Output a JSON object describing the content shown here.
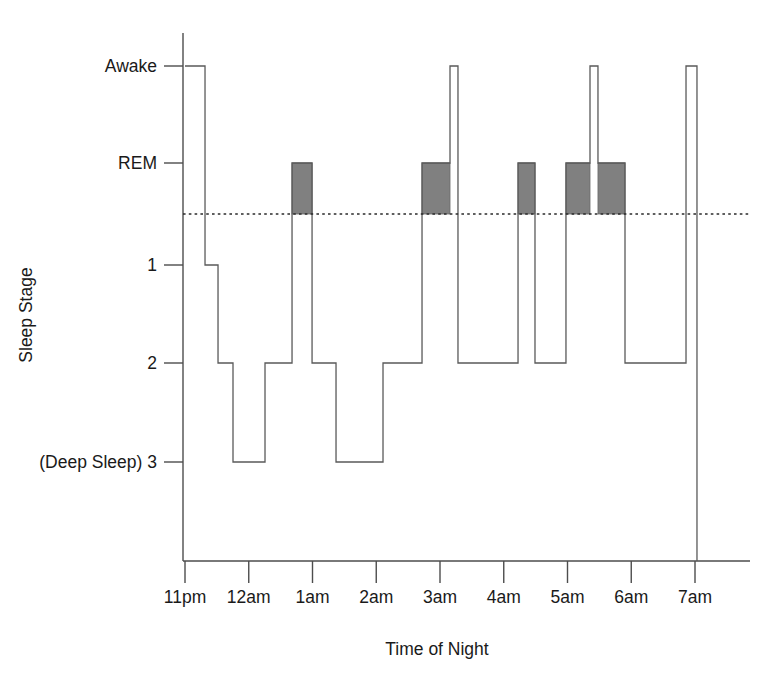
{
  "chart_data": {
    "type": "line",
    "title": "",
    "xlabel": "Time of Night",
    "ylabel": "Sleep Stage",
    "grid": false,
    "legend": "none",
    "x_tick_labels": [
      "11pm",
      "12am",
      "1am",
      "2am",
      "3am",
      "4am",
      "5am",
      "6am",
      "7am"
    ],
    "x_tick_hours": [
      0,
      1,
      2,
      3,
      4,
      5,
      6,
      7,
      8
    ],
    "xlim_hours": [
      0,
      8
    ],
    "y_tick_labels": [
      "Awake",
      "REM",
      "1",
      "2",
      "(Deep Sleep) 3"
    ],
    "y_levels": {
      "Awake": 0,
      "REM": 1,
      "1": 2,
      "2": 3,
      "3": 4
    },
    "threshold_level": 1.5,
    "threshold_note": "dotted reference line between REM and stage 1",
    "rem_fill_color": "#808080",
    "trace_color": "#5a5a5a",
    "axis_color": "#4d4d4d",
    "segments": [
      {
        "start_hours": 0.0,
        "end_hours": 0.314,
        "stage": "Awake"
      },
      {
        "start_hours": 0.314,
        "end_hours": 0.518,
        "stage": "1"
      },
      {
        "start_hours": 0.518,
        "end_hours": 0.753,
        "stage": "2"
      },
      {
        "start_hours": 0.753,
        "end_hours": 1.255,
        "stage": "3"
      },
      {
        "start_hours": 1.255,
        "end_hours": 1.679,
        "stage": "2"
      },
      {
        "start_hours": 1.679,
        "end_hours": 1.993,
        "stage": "REM"
      },
      {
        "start_hours": 1.993,
        "end_hours": 2.369,
        "stage": "2"
      },
      {
        "start_hours": 2.369,
        "end_hours": 3.106,
        "stage": "3"
      },
      {
        "start_hours": 3.106,
        "end_hours": 3.718,
        "stage": "2"
      },
      {
        "start_hours": 3.718,
        "end_hours": 4.157,
        "stage": "REM"
      },
      {
        "start_hours": 4.157,
        "end_hours": 4.282,
        "stage": "Awake"
      },
      {
        "start_hours": 4.282,
        "end_hours": 5.224,
        "stage": "2"
      },
      {
        "start_hours": 5.224,
        "end_hours": 5.49,
        "stage": "REM"
      },
      {
        "start_hours": 5.49,
        "end_hours": 5.976,
        "stage": "2"
      },
      {
        "start_hours": 5.976,
        "end_hours": 6.353,
        "stage": "REM"
      },
      {
        "start_hours": 6.353,
        "end_hours": 6.478,
        "stage": "Awake"
      },
      {
        "start_hours": 6.478,
        "end_hours": 6.902,
        "stage": "REM"
      },
      {
        "start_hours": 6.902,
        "end_hours": 7.859,
        "stage": "2"
      },
      {
        "start_hours": 7.859,
        "end_hours": 8.031,
        "stage": "Awake"
      }
    ],
    "rem_blocks": [
      {
        "start_hours": 1.679,
        "end_hours": 1.993
      },
      {
        "start_hours": 3.718,
        "end_hours": 4.157
      },
      {
        "start_hours": 5.224,
        "end_hours": 5.49
      },
      {
        "start_hours": 5.976,
        "end_hours": 6.353
      },
      {
        "start_hours": 6.478,
        "end_hours": 6.902
      }
    ],
    "awake_spikes_hours": [
      4.157,
      6.353,
      7.859
    ]
  }
}
